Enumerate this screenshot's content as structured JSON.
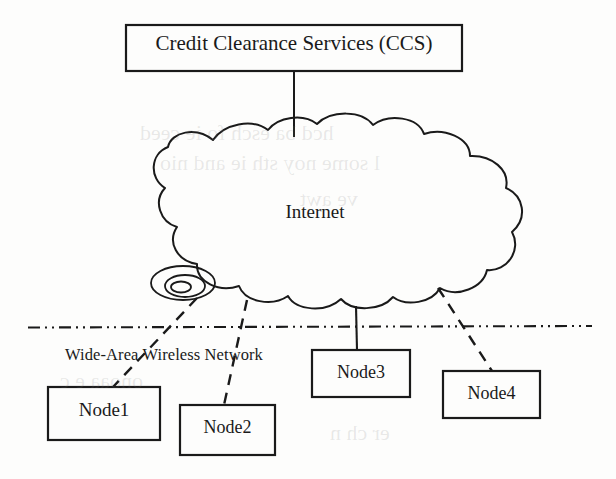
{
  "diagram": {
    "title_box": {
      "label": "Credit Clearance Services (CCS)",
      "x": 126,
      "y": 25,
      "w": 336,
      "h": 46
    },
    "cloud": {
      "label": "Internet",
      "x": 105,
      "y": 128,
      "w": 420,
      "h": 175
    },
    "base_station": {
      "name": "base-station-antenna",
      "cx": 183,
      "cy": 283
    },
    "boundary_line": {
      "name": "wide-area-wireless-boundary",
      "style": "dash-dot-dot",
      "x1": 28,
      "y1": 327,
      "x2": 592,
      "y2": 326
    },
    "network_label": "Wide-Area Wireless Network",
    "nodes": [
      {
        "label": "Node1",
        "x": 48,
        "y": 387,
        "w": 112,
        "h": 53,
        "link": "dashed"
      },
      {
        "label": "Node2",
        "x": 180,
        "y": 405,
        "w": 95,
        "h": 50,
        "link": "dashed"
      },
      {
        "label": "Node3",
        "x": 312,
        "y": 350,
        "w": 98,
        "h": 47,
        "link": "solid"
      },
      {
        "label": "Node4",
        "x": 443,
        "y": 371,
        "w": 97,
        "h": 47,
        "link": "dashed"
      }
    ],
    "connectors": [
      {
        "name": "ccs-to-internet-link",
        "style": "solid",
        "from": "Credit Clearance Services (CCS)",
        "to": "Internet"
      },
      {
        "name": "internet-to-node1-link",
        "style": "dashed",
        "from": "Internet",
        "to": "Node1"
      },
      {
        "name": "internet-to-node2-link",
        "style": "dashed",
        "from": "Internet",
        "to": "Node2"
      },
      {
        "name": "internet-to-node3-link",
        "style": "solid",
        "from": "Internet",
        "to": "Node3"
      },
      {
        "name": "internet-to-node4-link",
        "style": "dashed",
        "from": "Internet",
        "to": "Node4"
      }
    ],
    "colors": {
      "ink": "#1a1a1a",
      "paper": "#fdfdfc"
    }
  }
}
